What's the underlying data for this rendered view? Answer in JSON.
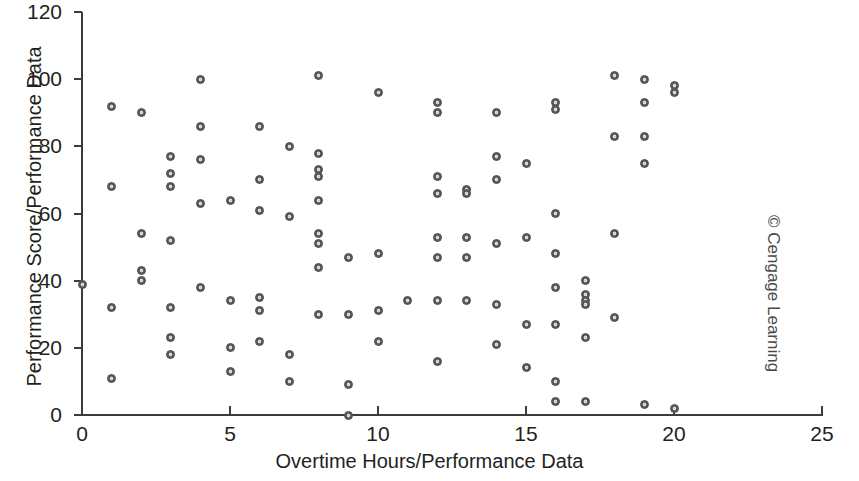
{
  "credit": "© Cengage Learning",
  "chart_data": {
    "type": "scatter",
    "title": "",
    "xlabel": "Overtime Hours/Performance Data",
    "ylabel": "Performance Score/Performance Data",
    "xlim": [
      0,
      25
    ],
    "ylim": [
      0,
      120
    ],
    "xticks": [
      0,
      5,
      10,
      15,
      20,
      25
    ],
    "yticks": [
      0,
      20,
      40,
      60,
      80,
      100,
      120
    ],
    "xtick_labels": [
      "0",
      "5",
      "10",
      "15",
      "20",
      "25"
    ],
    "ytick_labels": [
      "0",
      "20",
      "40",
      "60",
      "80",
      "100",
      "120"
    ],
    "grid": false,
    "legend": null,
    "marker": {
      "shape": "circle-open",
      "fill_color": "#8f8f8f",
      "edge_color": "#4a4a4a",
      "size_px": 9
    },
    "axis_color": "#3c3c3c",
    "background_color": "#ffffff",
    "n_points": 98,
    "points": [
      {
        "x": 0,
        "y": 39
      },
      {
        "x": 1,
        "y": 92
      },
      {
        "x": 1,
        "y": 68
      },
      {
        "x": 1,
        "y": 32
      },
      {
        "x": 1,
        "y": 11
      },
      {
        "x": 2,
        "y": 90
      },
      {
        "x": 2,
        "y": 54
      },
      {
        "x": 2,
        "y": 43
      },
      {
        "x": 2,
        "y": 40
      },
      {
        "x": 3,
        "y": 77
      },
      {
        "x": 3,
        "y": 72
      },
      {
        "x": 3,
        "y": 68
      },
      {
        "x": 3,
        "y": 52
      },
      {
        "x": 3,
        "y": 32
      },
      {
        "x": 3,
        "y": 23
      },
      {
        "x": 3,
        "y": 18
      },
      {
        "x": 4,
        "y": 100
      },
      {
        "x": 4,
        "y": 86
      },
      {
        "x": 4,
        "y": 76
      },
      {
        "x": 4,
        "y": 63
      },
      {
        "x": 4,
        "y": 38
      },
      {
        "x": 5,
        "y": 64
      },
      {
        "x": 5,
        "y": 34
      },
      {
        "x": 5,
        "y": 20
      },
      {
        "x": 5,
        "y": 13
      },
      {
        "x": 6,
        "y": 86
      },
      {
        "x": 6,
        "y": 70
      },
      {
        "x": 6,
        "y": 61
      },
      {
        "x": 6,
        "y": 35
      },
      {
        "x": 6,
        "y": 31
      },
      {
        "x": 6,
        "y": 22
      },
      {
        "x": 7,
        "y": 80
      },
      {
        "x": 7,
        "y": 59
      },
      {
        "x": 7,
        "y": 18
      },
      {
        "x": 7,
        "y": 10
      },
      {
        "x": 8,
        "y": 101
      },
      {
        "x": 8,
        "y": 78
      },
      {
        "x": 8,
        "y": 73
      },
      {
        "x": 8,
        "y": 71
      },
      {
        "x": 8,
        "y": 64
      },
      {
        "x": 8,
        "y": 54
      },
      {
        "x": 8,
        "y": 51
      },
      {
        "x": 8,
        "y": 44
      },
      {
        "x": 8,
        "y": 30
      },
      {
        "x": 9,
        "y": 47
      },
      {
        "x": 9,
        "y": 30
      },
      {
        "x": 9,
        "y": 9
      },
      {
        "x": 9,
        "y": 0
      },
      {
        "x": 10,
        "y": 96
      },
      {
        "x": 10,
        "y": 48
      },
      {
        "x": 10,
        "y": 31
      },
      {
        "x": 10,
        "y": 22
      },
      {
        "x": 11,
        "y": 34
      },
      {
        "x": 12,
        "y": 93
      },
      {
        "x": 12,
        "y": 90
      },
      {
        "x": 12,
        "y": 71
      },
      {
        "x": 12,
        "y": 66
      },
      {
        "x": 12,
        "y": 53
      },
      {
        "x": 12,
        "y": 47
      },
      {
        "x": 12,
        "y": 34
      },
      {
        "x": 12,
        "y": 16
      },
      {
        "x": 13,
        "y": 67
      },
      {
        "x": 13,
        "y": 66
      },
      {
        "x": 13,
        "y": 53
      },
      {
        "x": 13,
        "y": 47
      },
      {
        "x": 13,
        "y": 34
      },
      {
        "x": 14,
        "y": 90
      },
      {
        "x": 14,
        "y": 77
      },
      {
        "x": 14,
        "y": 70
      },
      {
        "x": 14,
        "y": 51
      },
      {
        "x": 14,
        "y": 33
      },
      {
        "x": 14,
        "y": 21
      },
      {
        "x": 15,
        "y": 75
      },
      {
        "x": 15,
        "y": 53
      },
      {
        "x": 15,
        "y": 27
      },
      {
        "x": 15,
        "y": 14
      },
      {
        "x": 16,
        "y": 93
      },
      {
        "x": 16,
        "y": 91
      },
      {
        "x": 16,
        "y": 60
      },
      {
        "x": 16,
        "y": 48
      },
      {
        "x": 16,
        "y": 38
      },
      {
        "x": 16,
        "y": 27
      },
      {
        "x": 16,
        "y": 10
      },
      {
        "x": 16,
        "y": 4
      },
      {
        "x": 17,
        "y": 40
      },
      {
        "x": 17,
        "y": 36
      },
      {
        "x": 17,
        "y": 34
      },
      {
        "x": 17,
        "y": 33
      },
      {
        "x": 17,
        "y": 23
      },
      {
        "x": 17,
        "y": 4
      },
      {
        "x": 18,
        "y": 101
      },
      {
        "x": 18,
        "y": 83
      },
      {
        "x": 18,
        "y": 54
      },
      {
        "x": 18,
        "y": 29
      },
      {
        "x": 19,
        "y": 100
      },
      {
        "x": 19,
        "y": 93
      },
      {
        "x": 19,
        "y": 83
      },
      {
        "x": 19,
        "y": 75
      },
      {
        "x": 19,
        "y": 3
      },
      {
        "x": 20,
        "y": 98
      },
      {
        "x": 20,
        "y": 96
      },
      {
        "x": 20,
        "y": 2
      }
    ]
  }
}
